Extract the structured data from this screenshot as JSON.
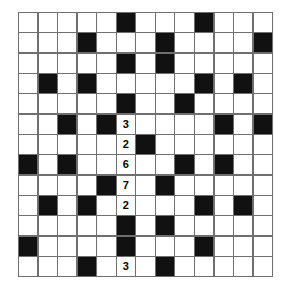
{
  "puzzle": {
    "type": "crossword-grid",
    "rows": 13,
    "columns": 13,
    "colors": {
      "background": "#ffffff",
      "block": "#111111",
      "grid_line": "#6f6f6f",
      "digit": "#000000"
    },
    "block_cells": [
      [
        1,
        6
      ],
      [
        1,
        10
      ],
      [
        2,
        4
      ],
      [
        2,
        8
      ],
      [
        2,
        13
      ],
      [
        3,
        6
      ],
      [
        3,
        8
      ],
      [
        4,
        2
      ],
      [
        4,
        4
      ],
      [
        4,
        10
      ],
      [
        4,
        12
      ],
      [
        5,
        6
      ],
      [
        5,
        9
      ],
      [
        6,
        3
      ],
      [
        6,
        5
      ],
      [
        6,
        11
      ],
      [
        6,
        13
      ],
      [
        7,
        7
      ],
      [
        8,
        1
      ],
      [
        8,
        3
      ],
      [
        8,
        9
      ],
      [
        8,
        11
      ],
      [
        9,
        5
      ],
      [
        9,
        8
      ],
      [
        10,
        2
      ],
      [
        10,
        4
      ],
      [
        10,
        10
      ],
      [
        10,
        12
      ],
      [
        11,
        6
      ],
      [
        11,
        8
      ],
      [
        12,
        1
      ],
      [
        12,
        6
      ],
      [
        12,
        10
      ],
      [
        13,
        4
      ],
      [
        13,
        8
      ]
    ],
    "filled_digits": [
      {
        "row": 6,
        "col": 6,
        "value": "3"
      },
      {
        "row": 7,
        "col": 6,
        "value": "2"
      },
      {
        "row": 8,
        "col": 6,
        "value": "6"
      },
      {
        "row": 9,
        "col": 6,
        "value": "7"
      },
      {
        "row": 10,
        "col": 6,
        "value": "2"
      },
      {
        "row": 13,
        "col": 6,
        "value": "3"
      }
    ]
  }
}
